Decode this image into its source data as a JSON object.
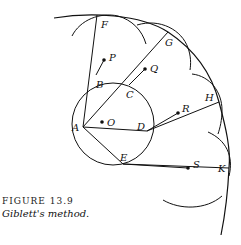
{
  "figure": {
    "number_label": "FIGURE 13.9",
    "title": "Giblett's method."
  },
  "points": {
    "A": "A",
    "B": "B",
    "C": "C",
    "D": "D",
    "E": "E",
    "F": "F",
    "G": "G",
    "H": "H",
    "K": "K",
    "O": "O",
    "P": "P",
    "Q": "Q",
    "R": "R",
    "S": "S"
  },
  "colors": {
    "stroke": "#111111",
    "background": "#ffffff"
  }
}
